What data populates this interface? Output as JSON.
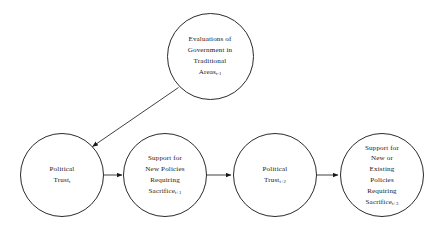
{
  "diagram": {
    "background_color": "#ffffff",
    "stroke_color": "#2b2b2b",
    "text_color": "#1a1a1a",
    "nodes": [
      {
        "id": "evaluations",
        "lines": [
          "Evaluations of",
          "Government in",
          "Traditional",
          "Areas"
        ],
        "subscript": "t-1",
        "cx": 210,
        "cy": 56,
        "d": 87
      },
      {
        "id": "political-trust-t",
        "lines": [
          "Political",
          "Trust"
        ],
        "subscript": "t",
        "cx": 62,
        "cy": 175,
        "d": 84
      },
      {
        "id": "support-new-policies",
        "lines": [
          "Support for",
          "New Policies",
          "Requiring",
          "Sacrifice"
        ],
        "subscript": "t+1",
        "cx": 165,
        "cy": 175,
        "d": 84
      },
      {
        "id": "political-trust-t2",
        "lines": [
          "Political",
          "Trust"
        ],
        "subscript": "t+2",
        "cx": 275,
        "cy": 175,
        "d": 84
      },
      {
        "id": "support-new-or-existing",
        "lines": [
          "Support for",
          "New or",
          "Existing",
          "Policies",
          "Requiring",
          "Sacrifice"
        ],
        "subscript": "t+3",
        "cx": 382,
        "cy": 175,
        "d": 84
      }
    ],
    "edges": [
      {
        "id": "evaluations-to-trust-t",
        "from": "evaluations",
        "to": "political-trust-t",
        "kind": "diagonal-arrow"
      },
      {
        "id": "trust-t-to-support-t1",
        "from": "political-trust-t",
        "to": "support-new-policies",
        "kind": "horizontal-arrow"
      },
      {
        "id": "support-t1-to-trust-t2",
        "from": "support-new-policies",
        "to": "political-trust-t2",
        "kind": "horizontal-arrow"
      },
      {
        "id": "trust-t2-to-support-t3",
        "from": "political-trust-t2",
        "to": "support-new-or-existing",
        "kind": "horizontal-arrow"
      }
    ]
  }
}
